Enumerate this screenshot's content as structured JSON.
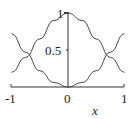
{
  "chart_data": {
    "type": "line",
    "title": "",
    "xlabel": "x",
    "ylabel": "",
    "xlim": [
      -1,
      1
    ],
    "ylim": [
      0,
      1
    ],
    "x_ticks": [
      "-1",
      "0",
      "1"
    ],
    "y_ticks": [
      "0.5",
      "1"
    ],
    "grid": false,
    "legend": null,
    "x": [
      -1,
      -0.75,
      -0.5,
      -0.25,
      0,
      0.25,
      0.5,
      0.75,
      1
    ],
    "series": [
      {
        "name": "peak curve",
        "values": [
          0.2,
          0.4,
          0.65,
          0.9,
          1.0,
          0.9,
          0.65,
          0.4,
          0.2
        ]
      },
      {
        "name": "valley curve",
        "values": [
          0.72,
          0.47,
          0.22,
          0.06,
          0.0,
          0.06,
          0.22,
          0.47,
          0.72
        ]
      }
    ]
  },
  "labels": {
    "xm1": "-1",
    "x0": "0",
    "x1": "1",
    "y05": "0.5",
    "y1": "1",
    "xlabel": "x"
  }
}
